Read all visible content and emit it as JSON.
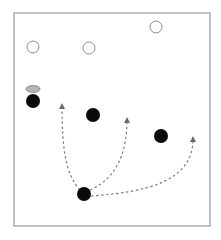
{
  "frame": {
    "x": 14,
    "y": 13,
    "width": 196,
    "height": 213,
    "stroke": "#9a9a9a"
  },
  "colors": {
    "outline_circle_stroke": "#8c8c8c",
    "filled_dot": "#0a0a0a",
    "ellipse_fill": "#b5b5b5",
    "ellipse_stroke": "#7a7a7a",
    "arrow": "#7d7d7d"
  },
  "outline_circles": [
    {
      "id": "open-circle-1",
      "cx": 33,
      "cy": 47,
      "r": 6
    },
    {
      "id": "open-circle-2",
      "cx": 89,
      "cy": 48,
      "r": 6
    },
    {
      "id": "open-circle-3",
      "cx": 156,
      "cy": 27,
      "r": 6
    }
  ],
  "ellipse": {
    "id": "gray-ellipse",
    "cx": 33,
    "cy": 89,
    "rx": 7,
    "ry": 3.5
  },
  "filled_dots": [
    {
      "id": "black-dot-left",
      "cx": 33,
      "cy": 101,
      "r": 7
    },
    {
      "id": "black-dot-middle",
      "cx": 93,
      "cy": 115,
      "r": 7
    },
    {
      "id": "black-dot-right",
      "cx": 161,
      "cy": 136,
      "r": 7
    },
    {
      "id": "black-dot-origin",
      "cx": 84,
      "cy": 194,
      "r": 7
    }
  ],
  "arrows": [
    {
      "id": "arrow-to-left",
      "d": "M 80 190 C 66 175, 62 150, 62 106",
      "tip": {
        "x": 62,
        "y": 104
      }
    },
    {
      "id": "arrow-to-middle",
      "d": "M 90 190 C 118 178, 127 150, 127 120",
      "tip": {
        "x": 127,
        "y": 118
      }
    },
    {
      "id": "arrow-to-right",
      "d": "M 91 196 C 150 192, 193 180, 193 139",
      "tip": {
        "x": 193,
        "y": 137
      }
    }
  ]
}
